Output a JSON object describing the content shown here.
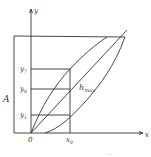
{
  "diagram": {
    "axes": {
      "x_label": "x",
      "y_label": "y",
      "origin_label": "0"
    },
    "labels": {
      "amplitude": "A",
      "y7": "y",
      "y7_sub": "7",
      "y0": "y",
      "y0_sub": "0",
      "y1": "y",
      "y1_sub": "1",
      "x0": "x",
      "x0_sub": "0",
      "hmax": "h",
      "hmax_sub": "max"
    },
    "caption_fragment": "...",
    "colors": {
      "line": "#333333",
      "background": "#ffffff"
    }
  }
}
